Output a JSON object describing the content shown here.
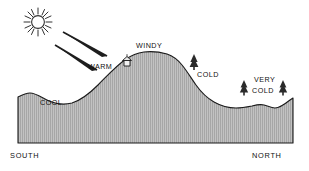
{
  "diagram": {
    "background_color": "#ffffff",
    "terrain_fill": "#b8b8b8",
    "terrain_outline": "#1a1a1a",
    "labels": {
      "warm": "WARM",
      "windy": "WINDY",
      "cold": "COLD",
      "very": "VERY",
      "very_cold": "COLD",
      "cool": "COOL",
      "south": "SOUTH",
      "north": "NORTH"
    },
    "icons": {
      "sun": "sun-icon",
      "ray_one": "sun-ray-arrow-icon",
      "ray_two": "sun-ray-arrow-icon",
      "hut": "hut-icon",
      "tree_one": "tree-icon",
      "tree_two": "tree-icon",
      "tree_three": "tree-icon"
    }
  }
}
